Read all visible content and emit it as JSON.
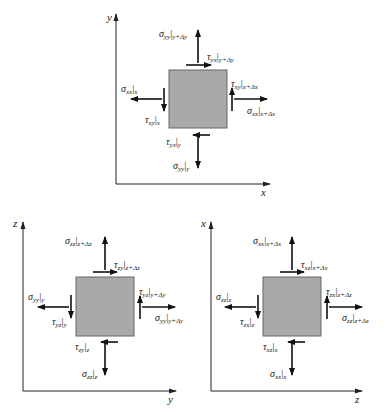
{
  "figure": {
    "panels": [
      {
        "id": "xy-plane",
        "axes": {
          "horizontal": "x",
          "vertical": "y"
        },
        "labels": {
          "top_normal": {
            "sym": "σ",
            "sub": "yy",
            "eval": "y+Δy"
          },
          "top_shear": {
            "sym": "τ",
            "sub": "yx",
            "eval": "y+Δy"
          },
          "left_normal": {
            "sym": "σ",
            "sub": "xx",
            "eval": "x"
          },
          "left_shear": {
            "sym": "τ",
            "sub": "xy",
            "eval": "x"
          },
          "right_shear": {
            "sym": "τ",
            "sub": "xy",
            "eval": "x+Δx"
          },
          "right_normal": {
            "sym": "σ",
            "sub": "xx",
            "eval": "x+Δx"
          },
          "bottom_shear": {
            "sym": "τ",
            "sub": "yx",
            "eval": "y"
          },
          "bottom_normal": {
            "sym": "σ",
            "sub": "yy",
            "eval": "y"
          }
        }
      },
      {
        "id": "yz-plane",
        "axes": {
          "horizontal": "y",
          "vertical": "z"
        },
        "labels": {
          "top_normal": {
            "sym": "σ",
            "sub": "zz",
            "eval": "z+Δz"
          },
          "top_shear": {
            "sym": "τ",
            "sub": "zy",
            "eval": "z+Δz"
          },
          "left_normal": {
            "sym": "σ",
            "sub": "yy",
            "eval": "y"
          },
          "left_shear": {
            "sym": "τ",
            "sub": "yz",
            "eval": "y"
          },
          "right_shear": {
            "sym": "τ",
            "sub": "yz",
            "eval": "y+Δy"
          },
          "right_normal": {
            "sym": "σ",
            "sub": "yy",
            "eval": "y+Δy"
          },
          "bottom_shear": {
            "sym": "τ",
            "sub": "zy",
            "eval": "z"
          },
          "bottom_normal": {
            "sym": "σ",
            "sub": "zz",
            "eval": "z"
          }
        }
      },
      {
        "id": "zx-plane",
        "axes": {
          "horizontal": "z",
          "vertical": "x"
        },
        "labels": {
          "top_normal": {
            "sym": "σ",
            "sub": "xx",
            "eval": "x+Δx"
          },
          "top_shear": {
            "sym": "τ",
            "sub": "xz",
            "eval": "x+Δx"
          },
          "left_normal": {
            "sym": "σ",
            "sub": "zz",
            "eval": "z"
          },
          "left_shear": {
            "sym": "τ",
            "sub": "zx",
            "eval": "z"
          },
          "right_shear": {
            "sym": "τ",
            "sub": "zx",
            "eval": "z+Δz"
          },
          "right_normal": {
            "sym": "σ",
            "sub": "zz",
            "eval": "z+Δz"
          },
          "bottom_shear": {
            "sym": "τ",
            "sub": "xz",
            "eval": "x"
          },
          "bottom_normal": {
            "sym": "σ",
            "sub": "xx",
            "eval": "x"
          }
        }
      }
    ],
    "colors": {
      "element_fill": "#a9a9a9",
      "ink": "#111111"
    }
  }
}
